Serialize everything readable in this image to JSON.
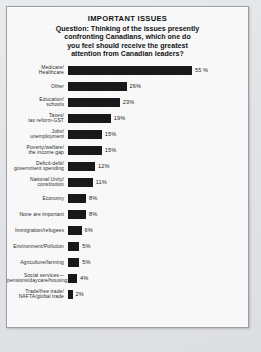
{
  "chart_data": {
    "type": "bar",
    "orientation": "horizontal",
    "title": "IMPORTANT ISSUES",
    "question_label": "Question:",
    "question_text": "Thinking of the issues presently confronting Canadians, which one do you feel should receive the greatest attention from Canadian leaders?",
    "question_lines": [
      "Question: Thinking of the issues presently",
      "confronting Canadians, which one do",
      "you feel should receive the greatest",
      "attention from Canadian leaders?"
    ],
    "xlabel": "",
    "ylabel": "",
    "xlim": [
      0,
      55
    ],
    "grid": false,
    "legend": "none",
    "value_suffix": "%",
    "bar_color": "#17191b",
    "categories": [
      "Medicare/\nHealthcare",
      "Other",
      "Education/\nschools",
      "Taxes/\ntax reform-GST",
      "Jobs/\nunemployment",
      "Poverty/welfare/\nthe income gap",
      "Deficit-debt/\ngovernment spending",
      "National Unity/\nconstitution",
      "Economy",
      "None are important",
      "Immigration/refugees",
      "Environment/Pollution",
      "Agriculture/farming",
      "Social services—\npensions/daycare/housing",
      "Trade/free trade/\nNAFTA/global trade"
    ],
    "values": [
      55,
      26,
      23,
      19,
      15,
      15,
      12,
      11,
      8,
      8,
      6,
      5,
      5,
      4,
      2
    ],
    "value_labels": [
      "55 %",
      "26%",
      "23%",
      "19%",
      "15%",
      "15%",
      "12%",
      "11%",
      "8%",
      "8%",
      "6%",
      "5%",
      "5%",
      "4%",
      "2%"
    ],
    "rows": [
      {
        "label": "Medicare/\nHealthcare",
        "value": 55,
        "value_label": "55 %",
        "gap_before": false
      },
      {
        "label": "Other",
        "value": 26,
        "value_label": "26%",
        "gap_before": false
      },
      {
        "label": "Education/\nschools",
        "value": 23,
        "value_label": "23%",
        "gap_before": false
      },
      {
        "label": "Taxes/\ntax reform-GST",
        "value": 19,
        "value_label": "19%",
        "gap_before": false
      },
      {
        "label": "Jobs/\nunemployment",
        "value": 15,
        "value_label": "15%",
        "gap_before": false
      },
      {
        "label": "Poverty/welfare/\nthe income gap",
        "value": 15,
        "value_label": "15%",
        "gap_before": false
      },
      {
        "label": "Deficit-debt/\ngovernment spending",
        "value": 12,
        "value_label": "12%",
        "gap_before": false
      },
      {
        "label": "National Unity/\nconstitution",
        "value": 11,
        "value_label": "11%",
        "gap_before": false
      },
      {
        "label": "Economy",
        "value": 8,
        "value_label": "8%",
        "gap_before": true
      },
      {
        "label": "None are important",
        "value": 8,
        "value_label": "8%",
        "gap_before": true
      },
      {
        "label": "Immigration/refugees",
        "value": 6,
        "value_label": "6%",
        "gap_before": true
      },
      {
        "label": "Environment/Pollution",
        "value": 5,
        "value_label": "5%",
        "gap_before": true
      },
      {
        "label": "Agriculture/farming",
        "value": 5,
        "value_label": "5%",
        "gap_before": true
      },
      {
        "label": "Social services—\npensions/daycare/housing",
        "value": 4,
        "value_label": "4%",
        "gap_before": true
      },
      {
        "label": "Trade/free trade/\nNAFTA/global trade",
        "value": 2,
        "value_label": "2%",
        "gap_before": true
      }
    ]
  }
}
